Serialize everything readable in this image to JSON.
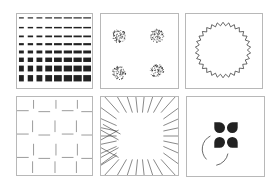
{
  "figure": {
    "layout": {
      "rows": 2,
      "cols": 3
    },
    "colors": {
      "ink": "#222222",
      "border": "#b8b8b8",
      "background": "#ffffff"
    },
    "panels": [
      {
        "id": "dash-grid",
        "description": "8x8 grid of dashes growing in thickness downward and length rightward",
        "rows": 8,
        "cols": 8
      },
      {
        "id": "noisy-inducers",
        "description": "four noisy speckled corner fragments forming an illusory square",
        "count": 4
      },
      {
        "id": "zigzag-ring",
        "description": "circular zigzag ring with sawtooth edge",
        "teeth": 30
      },
      {
        "id": "offset-lines",
        "description": "grid of short offset line segments forming illusory contours",
        "grid": 4
      },
      {
        "id": "radial-lines",
        "description": "radial line segments surrounding an empty square region with crossing lines on left"
      },
      {
        "id": "pacman-square",
        "description": "four pac-man inducers forming a Kanizsa square with a partial arc around bottom-left",
        "count": 4
      }
    ]
  }
}
